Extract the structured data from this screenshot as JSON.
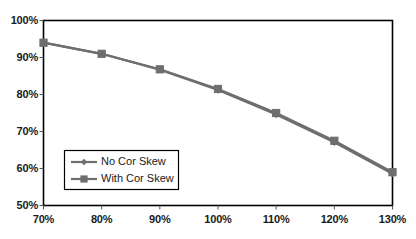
{
  "chart_data": {
    "type": "line",
    "title": "",
    "subtitle": "",
    "xlabel": "",
    "ylabel": "",
    "x": [
      70,
      80,
      90,
      100,
      110,
      120,
      130
    ],
    "categories": [
      "70%",
      "80%",
      "90%",
      "100%",
      "110%",
      "120%",
      "130%"
    ],
    "xtick_labels": [
      "70%",
      "80%",
      "90%",
      "100%",
      "110%",
      "120%",
      "130%"
    ],
    "ytick_labels": [
      "50%",
      "60%",
      "70%",
      "80%",
      "90%",
      "100%"
    ],
    "ytick_values": [
      50,
      60,
      70,
      80,
      90,
      100
    ],
    "xlim": [
      70,
      130
    ],
    "ylim": [
      50,
      100
    ],
    "grid": false,
    "legend_position": "inside-lower-left",
    "series": [
      {
        "name": "No Cor Skew",
        "marker": "diamond",
        "color": "#6e6e6e",
        "values": [
          94.0,
          91.0,
          86.7,
          81.2,
          74.6,
          67.1,
          58.6
        ]
      },
      {
        "name": "With Cor Skew",
        "marker": "square",
        "color": "#6e6e6e",
        "values": [
          94.0,
          91.0,
          86.8,
          81.5,
          75.0,
          67.5,
          59.0
        ]
      }
    ],
    "colors": {
      "axis": "#000000",
      "text": "#1a1a1a",
      "series_line": "#6e6e6e",
      "background": "#ffffff",
      "legend_border": "#000000"
    }
  },
  "legend": {
    "items": [
      {
        "label": "No Cor Skew",
        "marker": "diamond-marker"
      },
      {
        "label": "With Cor Skew",
        "marker": "square-marker"
      }
    ]
  }
}
